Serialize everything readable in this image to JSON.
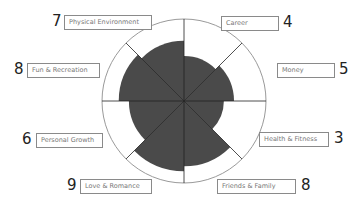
{
  "chart_data": {
    "type": "polar-area",
    "title": "",
    "scale_max": 10,
    "categories": [
      "Career",
      "Money",
      "Health & Fitness",
      "Friends & Family",
      "Love & Romance",
      "Personal Growth",
      "Fun & Recreation",
      "Physical Environment"
    ],
    "values": [
      4,
      5,
      3,
      8,
      9,
      6,
      8,
      7
    ],
    "grid": false,
    "legend": "none"
  },
  "colors": {
    "fill": "#4a4a4a",
    "ring": "#9a9a9a",
    "spoke": "#222222",
    "box_border": "#8a8a8a"
  },
  "labels": [
    {
      "name": "Career",
      "score": "4"
    },
    {
      "name": "Money",
      "score": "5"
    },
    {
      "name": "Health & Fitness",
      "score": "3"
    },
    {
      "name": "Friends & Family",
      "score": "8"
    },
    {
      "name": "Love & Romance",
      "score": "9"
    },
    {
      "name": "Personal Growth",
      "score": "6"
    },
    {
      "name": "Fun & Recreation",
      "score": "8"
    },
    {
      "name": "Physical Environment",
      "score": "7"
    }
  ]
}
